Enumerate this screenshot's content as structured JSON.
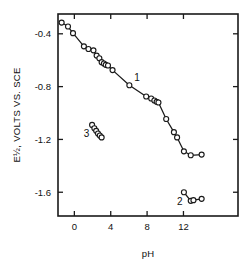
{
  "chart_data": {
    "type": "scatter",
    "title": "",
    "xlabel": "pH",
    "ylabel": "E½, VOLTS VS. SCE",
    "xlim": [
      -1.8,
      18.0
    ],
    "ylim": [
      -1.78,
      -0.25
    ],
    "grid": false,
    "legend": "none",
    "xticks": [
      0,
      4,
      8,
      12
    ],
    "xtick_labels": [
      "0",
      "4",
      "8",
      "12"
    ],
    "yticks": [
      -0.4,
      -0.8,
      -1.2,
      -1.6
    ],
    "ytick_labels": [
      "-0.4",
      "-0.8",
      "-1.2",
      "-1.6"
    ],
    "annotations": [
      {
        "text": "1",
        "x": 6.9,
        "y": -0.76
      },
      {
        "text": "2",
        "x": 11.6,
        "y": -1.7
      },
      {
        "text": "3",
        "x": 1.35,
        "y": -1.18
      }
    ],
    "series": [
      {
        "name": "1",
        "label": "1",
        "marker": "open-circle",
        "line": true,
        "points": [
          {
            "x": -1.4,
            "y": -0.315
          },
          {
            "x": -0.7,
            "y": -0.345
          },
          {
            "x": -0.15,
            "y": -0.395
          },
          {
            "x": 1.05,
            "y": -0.495
          },
          {
            "x": 1.55,
            "y": -0.515
          },
          {
            "x": 2.1,
            "y": -0.525
          },
          {
            "x": 2.45,
            "y": -0.565
          },
          {
            "x": 2.75,
            "y": -0.585
          },
          {
            "x": 3.0,
            "y": -0.615
          },
          {
            "x": 3.25,
            "y": -0.625
          },
          {
            "x": 3.45,
            "y": -0.635
          },
          {
            "x": 3.7,
            "y": -0.64
          },
          {
            "x": 4.2,
            "y": -0.675
          },
          {
            "x": 6.05,
            "y": -0.79
          },
          {
            "x": 7.9,
            "y": -0.875
          },
          {
            "x": 8.45,
            "y": -0.89
          },
          {
            "x": 8.8,
            "y": -0.905
          },
          {
            "x": 9.05,
            "y": -0.915
          },
          {
            "x": 9.25,
            "y": -0.92
          },
          {
            "x": 10.1,
            "y": -1.045
          },
          {
            "x": 10.95,
            "y": -1.145
          },
          {
            "x": 11.3,
            "y": -1.185
          },
          {
            "x": 12.05,
            "y": -1.29
          },
          {
            "x": 12.8,
            "y": -1.32
          },
          {
            "x": 14.0,
            "y": -1.315
          }
        ]
      },
      {
        "name": "2",
        "label": "2",
        "marker": "open-circle",
        "line": true,
        "points": [
          {
            "x": 12.05,
            "y": -1.6
          },
          {
            "x": 12.8,
            "y": -1.665
          },
          {
            "x": 13.1,
            "y": -1.66
          },
          {
            "x": 14.0,
            "y": -1.65
          }
        ]
      },
      {
        "name": "3",
        "label": "3",
        "marker": "open-circle",
        "line": true,
        "points": [
          {
            "x": 1.95,
            "y": -1.09
          },
          {
            "x": 2.2,
            "y": -1.115
          },
          {
            "x": 2.4,
            "y": -1.135
          },
          {
            "x": 2.6,
            "y": -1.155
          },
          {
            "x": 2.8,
            "y": -1.17
          },
          {
            "x": 3.0,
            "y": -1.185
          }
        ]
      }
    ]
  }
}
